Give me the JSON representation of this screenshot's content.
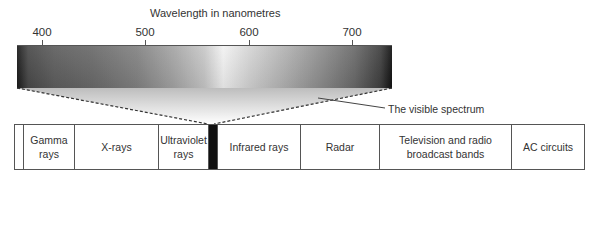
{
  "diagram": {
    "title": "Wavelength in nanometres",
    "axis": {
      "unit": "nanometres",
      "ticks": [
        {
          "label": "400",
          "x": 42
        },
        {
          "label": "500",
          "x": 145
        },
        {
          "label": "600",
          "x": 249
        },
        {
          "label": "700",
          "x": 352
        }
      ]
    },
    "visible_spectrum_callout": "The visible spectrum",
    "bands": [
      {
        "label": "",
        "width": 9
      },
      {
        "label": "Gamma rays",
        "width": 51
      },
      {
        "label": "X-rays",
        "width": 84
      },
      {
        "label": "Ultraviolet rays",
        "width": 50
      },
      {
        "label": "",
        "width": 8,
        "visible": true
      },
      {
        "label": "Infrared rays",
        "width": 84
      },
      {
        "label": "Radar",
        "width": 79
      },
      {
        "label": "Television and radio broadcast bands",
        "width": 132
      },
      {
        "label": "AC circuits",
        "width": 72
      }
    ]
  }
}
